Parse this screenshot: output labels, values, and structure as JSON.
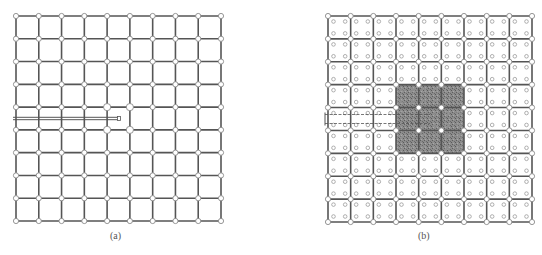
{
  "figure": {
    "panels": [
      {
        "id": "a",
        "label": "(a)",
        "grid": {
          "node_cols": 10,
          "node_rows": 10,
          "cells_x": 9,
          "cells_y": 9
        },
        "inner_cell_nodes": false,
        "highlighted_nodes": [
          [
            4,
            4
          ],
          [
            5,
            4
          ],
          [
            4,
            5
          ],
          [
            5,
            5
          ]
        ],
        "probe": {
          "row_between": [
            4,
            5
          ],
          "end_col": 4.5,
          "style": "double-line"
        },
        "shaded_region": null
      },
      {
        "id": "b",
        "label": "(b)",
        "grid": {
          "node_cols": 10,
          "node_rows": 10,
          "cells_x": 9,
          "cells_y": 9
        },
        "inner_cell_nodes": true,
        "inner_nodes_per_cell": 4,
        "highlighted_nodes": [],
        "probe": {
          "row_between": [
            4,
            5
          ],
          "end_col": 4.5,
          "style": "dashed-double-line"
        },
        "shaded_region": {
          "col_start": 3,
          "col_end": 6,
          "row_start": 3,
          "row_end": 6
        }
      }
    ],
    "colors": {
      "edge": "#555555",
      "node_fill": "#ffffff",
      "node_stroke": "#8a8a8a",
      "inner_node_stroke": "#9a9a9a",
      "shade": "#7a7a7a",
      "probe": "#555555"
    }
  }
}
